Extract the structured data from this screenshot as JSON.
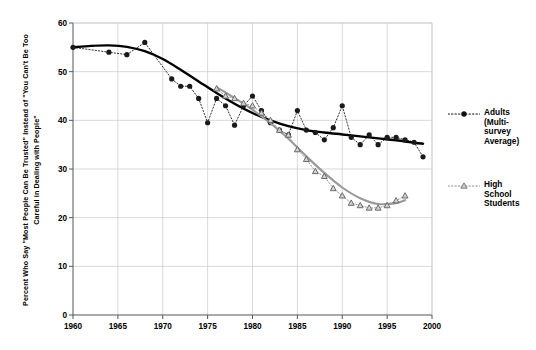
{
  "chart_data": {
    "type": "line",
    "title": "",
    "xlabel": "",
    "ylabel": "Percent Who Say \"Most People Can Be Trusted\" Instead of \"You Can't Be Too Careful in Dealing with People\"",
    "xlim": [
      1960,
      2000
    ],
    "ylim": [
      0,
      60
    ],
    "xticks": [
      1960,
      1965,
      1970,
      1975,
      1980,
      1985,
      1990,
      1995,
      2000
    ],
    "yticks": [
      0,
      10,
      20,
      30,
      40,
      50,
      60
    ],
    "grid": true,
    "legend_position": "right",
    "series": [
      {
        "name": "Adults (Multi-survey Average)",
        "marker": "circle",
        "color": "#1a1a1a",
        "linestyle": "dotted",
        "trend_color": "#000000",
        "x": [
          1960,
          1964,
          1966,
          1968,
          1971,
          1972,
          1973,
          1974,
          1975,
          1976,
          1977,
          1978,
          1979,
          1980,
          1981,
          1982,
          1983,
          1984,
          1985,
          1986,
          1987,
          1988,
          1989,
          1990,
          1991,
          1992,
          1993,
          1994,
          1995,
          1996,
          1997,
          1998,
          1999
        ],
        "y": [
          55.0,
          54.0,
          53.5,
          56.0,
          48.5,
          47.0,
          47.0,
          44.5,
          39.5,
          44.5,
          43.0,
          39.0,
          43.0,
          45.0,
          42.0,
          39.5,
          38.0,
          37.0,
          42.0,
          38.0,
          37.5,
          36.0,
          38.5,
          43.0,
          36.5,
          35.0,
          37.0,
          35.0,
          36.5,
          36.5,
          36.0,
          35.5,
          32.5
        ],
        "trend": {
          "x": [
            1960,
            1962,
            1964,
            1966,
            1968,
            1970,
            1972,
            1974,
            1976,
            1978,
            1980,
            1982,
            1984,
            1986,
            1988,
            1990,
            1992,
            1994,
            1996,
            1998,
            1999
          ],
          "y": [
            55.0,
            55.3,
            55.4,
            55.1,
            54.2,
            52.6,
            50.4,
            48.0,
            45.6,
            43.4,
            41.5,
            40.0,
            38.8,
            38.0,
            37.5,
            37.1,
            36.7,
            36.3,
            35.9,
            35.4,
            35.2
          ]
        }
      },
      {
        "name": "High School Students",
        "marker": "triangle",
        "color": "#8c8c8c",
        "linestyle": "dotted",
        "trend_color": "#9a9a9a",
        "x": [
          1976,
          1977,
          1978,
          1979,
          1980,
          1981,
          1982,
          1983,
          1984,
          1985,
          1986,
          1987,
          1988,
          1989,
          1990,
          1991,
          1992,
          1993,
          1994,
          1995,
          1996,
          1997
        ],
        "y": [
          46.5,
          45.0,
          44.5,
          43.5,
          43.0,
          41.5,
          40.0,
          38.0,
          37.0,
          34.0,
          32.0,
          29.5,
          28.5,
          26.0,
          24.5,
          23.0,
          22.5,
          22.0,
          22.0,
          22.5,
          23.5,
          24.5
        ],
        "trend": {
          "x": [
            1976,
            1978,
            1980,
            1982,
            1984,
            1986,
            1988,
            1990,
            1992,
            1994,
            1996,
            1997
          ],
          "y": [
            46.8,
            44.6,
            42.2,
            39.4,
            36.2,
            32.6,
            29.2,
            26.2,
            24.0,
            22.8,
            23.0,
            23.6
          ]
        }
      }
    ]
  },
  "legend": {
    "entries": [
      {
        "label": "Adults (Multi-survey Average)"
      },
      {
        "label": "High School Students"
      }
    ]
  },
  "axes": {
    "y_title": "Percent Who Say \"Most People Can Be Trusted\" Instead of \"You Can't Be Too Careful in Dealing with People\"",
    "x_tick_labels": [
      "1960",
      "1965",
      "1970",
      "1975",
      "1980",
      "1985",
      "1990",
      "1995",
      "2000"
    ],
    "y_tick_labels": [
      "0",
      "10",
      "20",
      "30",
      "40",
      "50",
      "60"
    ]
  },
  "colors": {
    "adults": "#111111",
    "students": "#8f8f8f",
    "grid": "#c8c8c8",
    "axis": "#555555",
    "background": "#ffffff"
  }
}
